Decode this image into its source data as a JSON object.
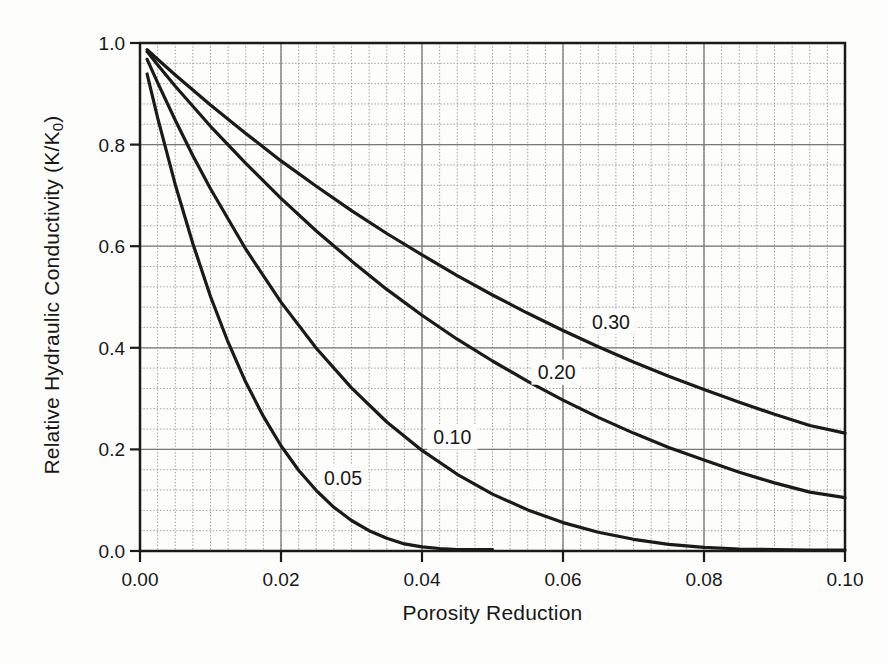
{
  "figure": {
    "width": 889,
    "height": 665,
    "background": "#fdfdfc"
  },
  "chart_data": {
    "type": "line",
    "title": "",
    "xlabel": "Porosity Reduction",
    "ylabel": "Relative Hydraulic Conductivity (K/K0)",
    "ylabel_main": "Relative Hydraulic Conductivity (K/K",
    "ylabel_sub": "0",
    "ylabel_close": ")",
    "xlim": [
      0,
      0.1
    ],
    "ylim": [
      0,
      1.0
    ],
    "x_tick_values": [
      0,
      0.02,
      0.04,
      0.06,
      0.08,
      0.1
    ],
    "x_tick_labels": [
      "0.00",
      "0.02",
      "0.04",
      "0.06",
      "0.08",
      "0.10"
    ],
    "y_tick_values": [
      0,
      0.2,
      0.4,
      0.6,
      0.8,
      1.0
    ],
    "y_tick_labels": [
      "0.0",
      "0.2",
      "0.4",
      "0.6",
      "0.8",
      "1.0"
    ],
    "x_minor_step": 0.0025,
    "y_minor_step": 0.04,
    "grid": {
      "major_color": "#787878",
      "minor_color": "#a0a0a0",
      "minor_dash": "1.5 1.8"
    },
    "axis_color": "#1a1a1a",
    "curve_color": "#1a1a1a",
    "curve_width": 3.2,
    "text_color": "#171717",
    "legend_position": "inline-curve-labels",
    "series": [
      {
        "name": "0.05",
        "label_x": 0.0288,
        "label_y": 0.144,
        "points": [
          [
            0.001,
            0.939
          ],
          [
            0.0025,
            0.853
          ],
          [
            0.005,
            0.721
          ],
          [
            0.0075,
            0.605
          ],
          [
            0.01,
            0.501
          ],
          [
            0.0125,
            0.411
          ],
          [
            0.015,
            0.332
          ],
          [
            0.0175,
            0.265
          ],
          [
            0.02,
            0.207
          ],
          [
            0.0225,
            0.159
          ],
          [
            0.025,
            0.119
          ],
          [
            0.0275,
            0.086
          ],
          [
            0.03,
            0.06
          ],
          [
            0.0325,
            0.04
          ],
          [
            0.035,
            0.025
          ],
          [
            0.0375,
            0.014
          ],
          [
            0.04,
            0.008
          ],
          [
            0.0425,
            0.005
          ],
          [
            0.045,
            0.003
          ],
          [
            0.0475,
            0.003
          ],
          [
            0.05,
            0.003
          ]
        ]
      },
      {
        "name": "0.10",
        "label_x": 0.0443,
        "label_y": 0.224,
        "points": [
          [
            0.001,
            0.968
          ],
          [
            0.0025,
            0.922
          ],
          [
            0.005,
            0.848
          ],
          [
            0.0075,
            0.778
          ],
          [
            0.01,
            0.713
          ],
          [
            0.015,
            0.594
          ],
          [
            0.02,
            0.49
          ],
          [
            0.025,
            0.399
          ],
          [
            0.03,
            0.321
          ],
          [
            0.035,
            0.254
          ],
          [
            0.04,
            0.198
          ],
          [
            0.045,
            0.151
          ],
          [
            0.05,
            0.112
          ],
          [
            0.055,
            0.081
          ],
          [
            0.06,
            0.056
          ],
          [
            0.065,
            0.037
          ],
          [
            0.07,
            0.023
          ],
          [
            0.075,
            0.013
          ],
          [
            0.08,
            0.007
          ],
          [
            0.085,
            0.004
          ],
          [
            0.09,
            0.003
          ],
          [
            0.095,
            0.002
          ],
          [
            0.1,
            0.002
          ]
        ]
      },
      {
        "name": "0.20",
        "label_x": 0.0591,
        "label_y": 0.352,
        "points": [
          [
            0.001,
            0.983
          ],
          [
            0.0025,
            0.957
          ],
          [
            0.005,
            0.915
          ],
          [
            0.01,
            0.836
          ],
          [
            0.015,
            0.763
          ],
          [
            0.02,
            0.694
          ],
          [
            0.025,
            0.63
          ],
          [
            0.03,
            0.571
          ],
          [
            0.035,
            0.515
          ],
          [
            0.04,
            0.464
          ],
          [
            0.045,
            0.417
          ],
          [
            0.05,
            0.374
          ],
          [
            0.055,
            0.334
          ],
          [
            0.06,
            0.297
          ],
          [
            0.065,
            0.263
          ],
          [
            0.07,
            0.232
          ],
          [
            0.075,
            0.204
          ],
          [
            0.08,
            0.179
          ],
          [
            0.085,
            0.155
          ],
          [
            0.09,
            0.134
          ],
          [
            0.095,
            0.116
          ],
          [
            0.1,
            0.105
          ]
        ]
      },
      {
        "name": "0.30",
        "label_x": 0.0668,
        "label_y": 0.451,
        "points": [
          [
            0.001,
            0.987
          ],
          [
            0.0025,
            0.968
          ],
          [
            0.005,
            0.937
          ],
          [
            0.01,
            0.878
          ],
          [
            0.015,
            0.822
          ],
          [
            0.02,
            0.768
          ],
          [
            0.025,
            0.718
          ],
          [
            0.03,
            0.67
          ],
          [
            0.035,
            0.625
          ],
          [
            0.04,
            0.583
          ],
          [
            0.045,
            0.542
          ],
          [
            0.05,
            0.504
          ],
          [
            0.055,
            0.468
          ],
          [
            0.06,
            0.434
          ],
          [
            0.065,
            0.402
          ],
          [
            0.07,
            0.372
          ],
          [
            0.075,
            0.344
          ],
          [
            0.08,
            0.318
          ],
          [
            0.085,
            0.293
          ],
          [
            0.09,
            0.269
          ],
          [
            0.095,
            0.247
          ],
          [
            0.1,
            0.232
          ]
        ]
      }
    ]
  }
}
